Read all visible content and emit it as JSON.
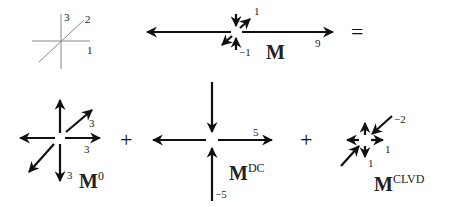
{
  "axes_key": {
    "labels": [
      "1",
      "2",
      "3"
    ],
    "axis_color": "#888888"
  },
  "equation": {
    "lhs": {
      "symbol": "M",
      "eigen_labels": {
        "horizontal": "9",
        "diag": "1",
        "vertical": "−1"
      }
    },
    "equals": "=",
    "plus": "+",
    "terms": [
      {
        "id": "isotropic",
        "symbol": "M",
        "superscript": "0",
        "eigen_labels": {
          "diag": "3",
          "horizontal": "3",
          "vertical": "3"
        }
      },
      {
        "id": "double_couple",
        "symbol": "M",
        "superscript": "DC",
        "eigen_labels": {
          "horizontal": "5",
          "vertical": "−5"
        }
      },
      {
        "id": "clvd",
        "symbol": "M",
        "superscript": "CLVD",
        "eigen_labels": {
          "diag": "−2",
          "horizontal": "1",
          "vertical": "1"
        }
      }
    ]
  },
  "colors": {
    "arrow": "#111111",
    "axis": "#888888",
    "text": "#222222"
  }
}
